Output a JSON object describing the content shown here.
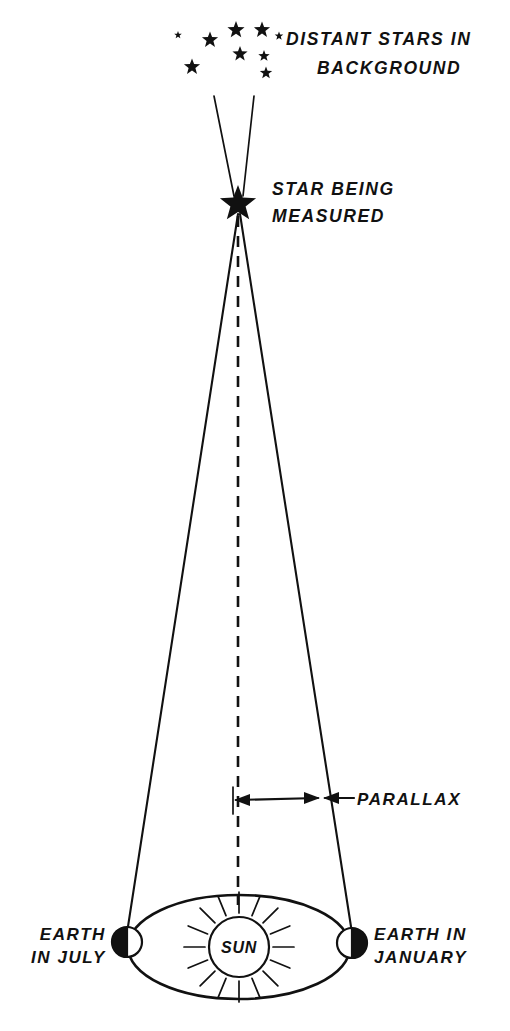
{
  "diagram": {
    "background_color": "#ffffff",
    "ink_color": "#111111",
    "labels": {
      "distant_stars_line1": "DISTANT STARS IN",
      "distant_stars_line2": "BACKGROUND",
      "star_measured_line1": "STAR BEING",
      "star_measured_line2": "MEASURED",
      "parallax": "PARALLAX",
      "earth_july_line1": "EARTH",
      "earth_july_line2": "IN JULY",
      "earth_january_line1": "EARTH IN",
      "earth_january_line2": "JANUARY",
      "sun": "SUN"
    },
    "icons": {
      "star_measured": "filled-five-point-star-icon",
      "background_star": "small-star-icon",
      "sun": "sun-with-rays-icon",
      "earth_july": "half-shaded-earth-icon",
      "earth_january": "half-shaded-earth-icon",
      "parallax_arrow": "double-headed-arrow-icon",
      "leader_arrow": "left-pointing-leader-arrow-icon"
    },
    "geometry": {
      "star_apex": {
        "x": 238,
        "y": 212
      },
      "star_glyph_center": {
        "x": 238,
        "y": 204
      },
      "star_glyph_radius": 19,
      "sight_line_left_end": {
        "x": 127,
        "y": 933
      },
      "sight_line_right_end": {
        "x": 352,
        "y": 933
      },
      "dashed_line_bottom": {
        "x": 238,
        "y": 905
      },
      "orbit_center": {
        "x": 239,
        "y": 947
      },
      "orbit_rx": 111,
      "orbit_ry": 52,
      "sun_center": {
        "x": 239,
        "y": 947
      },
      "sun_radius": 30,
      "sun_ray_count": 16,
      "sun_ray_inner": 34,
      "sun_ray_outer": 55,
      "earth_july_center": {
        "x": 127,
        "y": 942
      },
      "earth_january_center": {
        "x": 352,
        "y": 943
      },
      "earth_radius": 15,
      "parallax_arrow_y": 800,
      "parallax_arrow_x_left": 233,
      "parallax_arrow_x_right": 320,
      "upper_ray_left_top": {
        "x": 214,
        "y": 96
      },
      "upper_ray_right_top": {
        "x": 254,
        "y": 96
      }
    },
    "background_stars": [
      {
        "x": 178,
        "y": 35,
        "r": 4.0
      },
      {
        "x": 210,
        "y": 40,
        "r": 8.5
      },
      {
        "x": 236,
        "y": 30,
        "r": 9.0
      },
      {
        "x": 262,
        "y": 30,
        "r": 8.5
      },
      {
        "x": 192,
        "y": 67,
        "r": 8.5
      },
      {
        "x": 240,
        "y": 54,
        "r": 8.0
      },
      {
        "x": 264,
        "y": 56,
        "r": 6.0
      },
      {
        "x": 266,
        "y": 73,
        "r": 6.5
      },
      {
        "x": 279,
        "y": 36,
        "r": 4.5
      }
    ]
  }
}
